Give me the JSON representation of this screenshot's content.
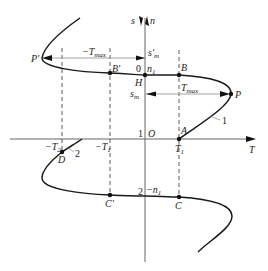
{
  "diagram": {
    "colors": {
      "curve": "#1a1a1a",
      "axis": "#555555",
      "arrow": "#888888",
      "dash": "#333333",
      "text": "#222222"
    },
    "axes": {
      "vertical": {
        "label_s": "s",
        "label_n": "n"
      },
      "horizontal": {
        "label": "T",
        "origin": "O"
      }
    },
    "levels": {
      "zero": "0",
      "one": "1",
      "two": "2",
      "n1": "n",
      "n1_sub": "1",
      "neg_n1": "−n",
      "neg_n1_sub": "1",
      "H": "H",
      "sm": "s",
      "sm_sub": "m",
      "sm_prime": "s′",
      "sm_prime_sub": "m"
    },
    "torques": {
      "tmax": "T",
      "tmax_sub": "max",
      "neg_tmax": "−T",
      "neg_tmax_sub": "max",
      "t1": "T",
      "t1_sub": "1",
      "neg_t1": "−T",
      "neg_t1_sub": "1",
      "neg_t2": "−T",
      "neg_t2_sub": "2"
    },
    "points": {
      "A": "A",
      "B": "B",
      "B_prime": "B′",
      "C": "C",
      "C_prime": "C′",
      "D": "D",
      "P": "P",
      "P_prime": "P′"
    },
    "curve_labels": {
      "curve1": "1",
      "curve2": "2"
    }
  }
}
